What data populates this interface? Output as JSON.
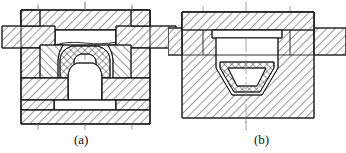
{
  "document": {
    "type": "engineering-drawing",
    "subject": "closed-die forging tooling cross-sections",
    "view": "half/full sectional views with hatching",
    "background_color": "#ffffff",
    "line_color": "#1a1a1a",
    "hatch_color": "#333333",
    "centerline_color": "#8a8a8a"
  },
  "figures": [
    {
      "id": "a",
      "caption": "(a)",
      "caption_x": 82,
      "caption_y": 134,
      "description": "Upper and lower die set with punch, die insert and domed forging in cavity; ejector pin below",
      "components": [
        {
          "name": "upper-die-plate",
          "hatch": "diag-right"
        },
        {
          "name": "upper-punch",
          "hatch": "diag-right"
        },
        {
          "name": "left-die-holder",
          "hatch": "diag-right"
        },
        {
          "name": "right-die-holder",
          "hatch": "diag-right"
        },
        {
          "name": "die-insert-left",
          "hatch": "diag-left"
        },
        {
          "name": "die-insert-right",
          "hatch": "diag-left"
        },
        {
          "name": "forging-workpiece",
          "hatch": "cross"
        },
        {
          "name": "ejector-pin",
          "hatch": "none"
        },
        {
          "name": "bottom-base-plate",
          "hatch": "diag-right"
        },
        {
          "name": "vertical-centerline",
          "hatch": "none"
        }
      ],
      "centerlines": [
        85,
        38,
        132
      ]
    },
    {
      "id": "b",
      "caption": "(b)",
      "caption_x": 262,
      "caption_y": 134,
      "description": "Die block with tapered cavity, top cover plate and cross-hatched billet seated at cavity bottom",
      "components": [
        {
          "name": "top-cover-plate",
          "hatch": "diag-right"
        },
        {
          "name": "left-side-plate",
          "hatch": "diag-right"
        },
        {
          "name": "right-side-plate",
          "hatch": "diag-right"
        },
        {
          "name": "die-block-body",
          "hatch": "diag-right"
        },
        {
          "name": "tapered-cavity",
          "hatch": "none"
        },
        {
          "name": "billet-workpiece",
          "hatch": "cross"
        },
        {
          "name": "vertical-centerline",
          "hatch": "none"
        }
      ],
      "centerlines": [
        246,
        203,
        290
      ]
    }
  ]
}
